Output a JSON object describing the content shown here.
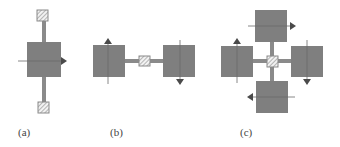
{
  "figure": {
    "colors": {
      "mass": "#7f7f7f",
      "rod": "#8a8a8a",
      "anchor_fill": "#f2f2f2",
      "anchor_stripe": "#9a9a9a",
      "axis_line": "#6a6a6a",
      "arrow": "#4a4a4a",
      "label": "#444444"
    },
    "panels": [
      {
        "id": "a",
        "label": "(a)",
        "description": "single proof mass suspended between two anchors by vertical beams, motion arrow pointing right"
      },
      {
        "id": "b",
        "label": "(b)",
        "description": "two proof masses coupled through a central anchor, left mass arrow up, right mass arrow down"
      },
      {
        "id": "c",
        "label": "(c)",
        "description": "four proof masses around a central anchor, arrows forming a clockwise rotation: top right, right down, bottom left, left up"
      }
    ]
  }
}
